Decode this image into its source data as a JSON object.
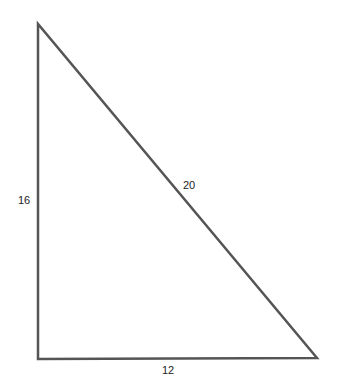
{
  "diagram": {
    "type": "right-triangle",
    "stroke_color": "#555555",
    "vertices": {
      "top": [
        38,
        24
      ],
      "bottom_left": [
        38,
        359
      ],
      "bottom_right": [
        317,
        358
      ]
    },
    "labels": {
      "left_side": "16",
      "hypotenuse": "20",
      "base": "12"
    }
  }
}
